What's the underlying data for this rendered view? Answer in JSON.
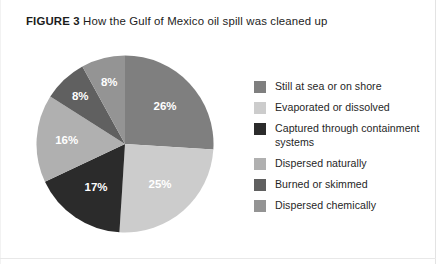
{
  "figure": {
    "label": "FIGURE 3",
    "caption": "How the Gulf of Mexico oil spill was cleaned up"
  },
  "chart_data": {
    "type": "pie",
    "title": "How the Gulf of Mexico oil spill was cleaned up",
    "xlabel": "",
    "ylabel": "",
    "units": "percent",
    "start_angle_deg": 0,
    "direction": "clockwise",
    "legend_position": "right",
    "grid": false,
    "categories": [
      "Still at sea or on shore",
      "Evaporated or dissolved",
      "Captured through containment systems",
      "Dispersed naturally",
      "Burned or skimmed",
      "Dispersed chemically"
    ],
    "values": [
      26,
      25,
      17,
      16,
      8,
      8
    ],
    "data_labels": [
      "26%",
      "25%",
      "17%",
      "16%",
      "8%",
      "8%"
    ],
    "colors": [
      "#7f7f7f",
      "#cccccc",
      "#2b2b2b",
      "#b0b0b0",
      "#606060",
      "#949494"
    ],
    "total": 100
  },
  "legend": {
    "items": [
      {
        "label": "Still at sea or on shore",
        "color": "#7f7f7f",
        "value": "26%"
      },
      {
        "label": "Evaporated or dissolved",
        "color": "#cccccc",
        "value": "25%"
      },
      {
        "label": "Captured through containment systems",
        "color": "#2b2b2b",
        "value": "17%"
      },
      {
        "label": "Dispersed naturally",
        "color": "#b0b0b0",
        "value": "16%"
      },
      {
        "label": "Burned or skimmed",
        "color": "#606060",
        "value": "8%"
      },
      {
        "label": "Dispersed chemically",
        "color": "#949494",
        "value": "8%"
      }
    ]
  }
}
